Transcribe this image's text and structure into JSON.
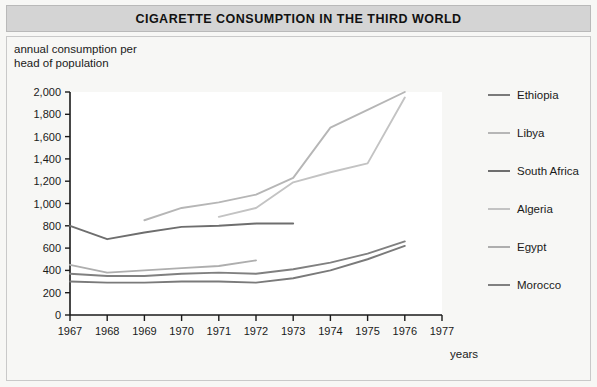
{
  "header": {
    "title": "CIGARETTE CONSUMPTION IN THE THIRD WORLD"
  },
  "axes": {
    "ylabel_line1": "annual consumption per",
    "ylabel_line2": "head of population",
    "xlabel": "years"
  },
  "chart_data": {
    "type": "line",
    "title": "CIGARETTE CONSUMPTION IN THE THIRD WORLD",
    "xlabel": "years",
    "ylabel": "annual consumption per head of population",
    "x": [
      1967,
      1968,
      1969,
      1970,
      1971,
      1972,
      1973,
      1974,
      1975,
      1976,
      1977
    ],
    "xlim": [
      1967,
      1977
    ],
    "ylim": [
      0,
      2000
    ],
    "yticks": [
      0,
      200,
      400,
      600,
      800,
      1000,
      1200,
      1400,
      1600,
      1800,
      2000
    ],
    "ytick_labels": [
      "0",
      "200",
      "400",
      "600",
      "800",
      "1,000",
      "1,200",
      "1,400",
      "1,600",
      "1,800",
      "2,000"
    ],
    "xticks": [
      1967,
      1968,
      1969,
      1970,
      1971,
      1972,
      1973,
      1974,
      1975,
      1976,
      1977
    ],
    "xtick_labels": [
      "1967",
      "1968",
      "1969",
      "1970",
      "1971",
      "1972",
      "1973",
      "1974",
      "1975",
      "1976",
      "1977"
    ],
    "grid": false,
    "legend_position": "right",
    "series": [
      {
        "name": "Ethiopia",
        "color": "#7a7a7a",
        "x": [
          1967,
          1968,
          1969,
          1970,
          1971,
          1972,
          1973,
          1974,
          1975,
          1976
        ],
        "values": [
          300,
          290,
          290,
          300,
          300,
          290,
          330,
          400,
          500,
          620
        ]
      },
      {
        "name": "Libya",
        "color": "#b6b6b6",
        "x": [
          1969,
          1970,
          1971,
          1972,
          1973,
          1974,
          1975,
          1976
        ],
        "values": [
          850,
          960,
          1010,
          1080,
          1230,
          1680,
          1840,
          2000
        ]
      },
      {
        "name": "South Africa",
        "color": "#6e6e6e",
        "x": [
          1967,
          1968,
          1969,
          1970,
          1971,
          1972,
          1973
        ],
        "values": [
          800,
          680,
          740,
          790,
          800,
          820,
          820
        ]
      },
      {
        "name": "Algeria",
        "color": "#c3c3c3",
        "x": [
          1971,
          1972,
          1973,
          1974,
          1975,
          1976
        ],
        "values": [
          880,
          960,
          1190,
          1280,
          1360,
          1950
        ]
      },
      {
        "name": "Egypt",
        "color": "#aeaeae",
        "x": [
          1967,
          1968,
          1969,
          1970,
          1971,
          1972
        ],
        "values": [
          450,
          380,
          400,
          420,
          440,
          490
        ]
      },
      {
        "name": "Morocco",
        "color": "#808080",
        "x": [
          1967,
          1968,
          1969,
          1970,
          1971,
          1972,
          1973,
          1974,
          1975,
          1976
        ],
        "values": [
          370,
          350,
          350,
          370,
          380,
          370,
          410,
          470,
          550,
          660
        ]
      }
    ]
  }
}
